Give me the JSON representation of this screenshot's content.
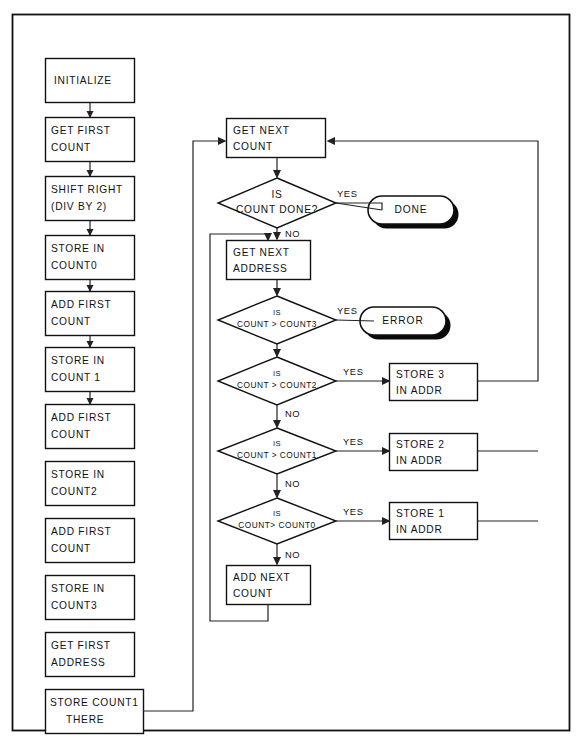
{
  "diagram": {
    "frame": {
      "x": 12,
      "y": 14,
      "width": 557,
      "height": 716
    },
    "colors": {
      "background": "#ffffff",
      "stroke": "#111111",
      "connector": "#222222",
      "shadow": "#0a0a0a"
    },
    "left_column": {
      "nodes": [
        {
          "id": "initialize",
          "shape": "process",
          "x": 45,
          "y": 58,
          "w": 90,
          "h": 44,
          "lines": [
            "INITIALIZE"
          ]
        },
        {
          "id": "get-first-count",
          "shape": "process",
          "x": 45,
          "y": 117,
          "w": 90,
          "h": 44,
          "lines": [
            "GET FIRST",
            "COUNT"
          ]
        },
        {
          "id": "shift-right",
          "shape": "process",
          "x": 45,
          "y": 176,
          "w": 90,
          "h": 44,
          "lines": [
            "SHIFT RIGHT",
            "(DIV BY 2)"
          ]
        },
        {
          "id": "store-count0",
          "shape": "process",
          "x": 45,
          "y": 235,
          "w": 90,
          "h": 44,
          "lines": [
            "STORE IN",
            "COUNT0"
          ]
        },
        {
          "id": "add-first-1",
          "shape": "process",
          "x": 45,
          "y": 288,
          "w": 90,
          "h": 44,
          "lines": [
            "ADD FIRST",
            "COUNT"
          ]
        },
        {
          "id": "store-count1",
          "shape": "process",
          "x": 45,
          "y": 347,
          "w": 90,
          "h": 44,
          "lines": [
            "STORE IN",
            "COUNT 1"
          ]
        },
        {
          "id": "add-first-2",
          "shape": "process",
          "x": 45,
          "y": 404,
          "w": 90,
          "h": 44,
          "lines": [
            "ADD FIRST",
            "COUNT"
          ]
        },
        {
          "id": "store-count2",
          "shape": "process",
          "x": 45,
          "y": 436,
          "w": 90,
          "h": 44,
          "lines": [
            "STORE IN",
            "COUNT2"
          ]
        },
        {
          "id": "add-first-3",
          "shape": "process",
          "x": 45,
          "y": 494,
          "w": 90,
          "h": 44,
          "lines": [
            "ADD FIRST",
            "COUNT"
          ]
        },
        {
          "id": "store-count3",
          "shape": "process",
          "x": 45,
          "y": 552,
          "w": 90,
          "h": 44,
          "lines": [
            "STORE IN",
            "COUNT3"
          ]
        },
        {
          "id": "get-first-addr",
          "shape": "process",
          "x": 45,
          "y": 605,
          "w": 90,
          "h": 44,
          "lines": [
            "GET FIRST",
            "ADDRESS"
          ]
        },
        {
          "id": "store-count1-there",
          "shape": "process",
          "x": 45,
          "y": 655,
          "w": 98,
          "h": 44,
          "lines": [
            "STORE COUNT1",
            "THERE"
          ]
        }
      ]
    },
    "right_column": {
      "nodes": [
        {
          "id": "get-next-count",
          "shape": "process",
          "lines": [
            "GET NEXT",
            "COUNT"
          ]
        },
        {
          "id": "is-count-done",
          "shape": "decision",
          "lines": [
            "IS",
            "COUNT DONE?"
          ]
        },
        {
          "id": "done",
          "shape": "terminator",
          "lines": [
            "DONE"
          ]
        },
        {
          "id": "get-next-address",
          "shape": "process",
          "lines": [
            "GET NEXT",
            "ADDRESS"
          ]
        },
        {
          "id": "is-gt-count3",
          "shape": "decision",
          "lines": [
            "IS",
            "COUNT > COUNT3"
          ]
        },
        {
          "id": "error",
          "shape": "terminator",
          "lines": [
            "ERROR"
          ]
        },
        {
          "id": "is-gt-count2",
          "shape": "decision",
          "lines": [
            "IS",
            "COUNT > COUNT2"
          ]
        },
        {
          "id": "store-3-in-addr",
          "shape": "process",
          "lines": [
            "STORE 3",
            "IN ADDR"
          ]
        },
        {
          "id": "is-gt-count1",
          "shape": "decision",
          "lines": [
            "IS",
            "COUNT > COUNT1"
          ]
        },
        {
          "id": "store-2-in-addr",
          "shape": "process",
          "lines": [
            "STORE 2",
            "IN ADDR"
          ]
        },
        {
          "id": "is-gt-count0",
          "shape": "decision",
          "lines": [
            "IS",
            "COUNT> COUNT0"
          ]
        },
        {
          "id": "store-1-in-addr",
          "shape": "process",
          "lines": [
            "STORE  1",
            "IN ADDR"
          ]
        },
        {
          "id": "add-next-count",
          "shape": "process",
          "lines": [
            "ADD NEXT",
            "COUNT"
          ]
        }
      ]
    },
    "labels": {
      "initialize": "INITIALIZE",
      "get_first_count_1": "GET FIRST",
      "get_first_count_2": "COUNT",
      "shift_right_1": "SHIFT RIGHT",
      "shift_right_2": "(DIV BY 2)",
      "store_count0_1": "STORE IN",
      "store_count0_2": "COUNT0",
      "add_first_a_1": "ADD FIRST",
      "add_first_a_2": "COUNT",
      "store_count1_1": "STORE IN",
      "store_count1_2": "COUNT 1",
      "add_first_b_1": "ADD FIRST",
      "add_first_b_2": "COUNT",
      "store_count2_1": "STORE IN",
      "store_count2_2": "COUNT2",
      "add_first_c_1": "ADD FIRST",
      "add_first_c_2": "COUNT",
      "store_count3_1": "STORE IN",
      "store_count3_2": "COUNT3",
      "get_first_address_1": "GET FIRST",
      "get_first_address_2": "ADDRESS",
      "store_count1_there_1": "STORE COUNT1",
      "store_count1_there_2": "THERE",
      "get_next_count_1": "GET NEXT",
      "get_next_count_2": "COUNT",
      "is_count_done_1": "IS",
      "is_count_done_2": "COUNT DONE?",
      "done": "DONE",
      "get_next_address_1": "GET NEXT",
      "get_next_address_2": "ADDRESS",
      "is_gt_count3_1": "IS",
      "is_gt_count3_2": "COUNT > COUNT3",
      "error": "ERROR",
      "is_gt_count2_1": "IS",
      "is_gt_count2_2": "COUNT > COUNT2",
      "store_3_in_addr_1": "STORE 3",
      "store_3_in_addr_2": "IN ADDR",
      "is_gt_count1_1": "IS",
      "is_gt_count1_2": "COUNT > COUNT1",
      "store_2_in_addr_1": "STORE 2",
      "store_2_in_addr_2": "IN ADDR",
      "is_gt_count0_1": "IS",
      "is_gt_count0_2": "COUNT> COUNT0",
      "store_1_in_addr_1": "STORE  1",
      "store_1_in_addr_2": "IN ADDR",
      "add_next_count_1": "ADD NEXT",
      "add_next_count_2": "COUNT"
    },
    "branch_labels": {
      "yes_done": "YES",
      "no_done": "NO",
      "yes_error": "YES",
      "yes_store3": "YES",
      "no_count2": "NO",
      "yes_store2": "YES",
      "no_count1": "NO",
      "yes_store1": "YES",
      "no_count0": "NO"
    }
  }
}
